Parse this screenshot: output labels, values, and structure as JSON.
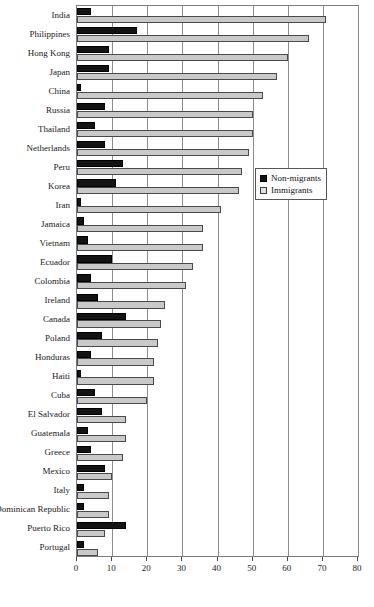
{
  "chart_data": {
    "type": "bar",
    "orientation": "horizontal",
    "title": "Table 4. Percentage of ...",
    "xlabel": "",
    "ylabel": "",
    "xlim": [
      0,
      80
    ],
    "xticks": [
      0,
      10,
      20,
      30,
      40,
      50,
      60,
      70,
      80
    ],
    "grid": true,
    "legend_position": "right-middle",
    "categories": [
      "India",
      "Philippines",
      "Hong Kong",
      "Japan",
      "China",
      "Russia",
      "Thailand",
      "Netherlands",
      "Peru",
      "Korea",
      "Iran",
      "Jamaica",
      "Vietnam",
      "Ecuador",
      "Colombia",
      "Ireland",
      "Canada",
      "Poland",
      "Honduras",
      "Haiti",
      "Cuba",
      "El Salvador",
      "Guatemala",
      "Greece",
      "Mexico",
      "Italy",
      "Dominican Republic",
      "Puerto Rico",
      "Portugal"
    ],
    "series": [
      {
        "name": "Non-migrants",
        "color": "#131313",
        "values": [
          4,
          17,
          9,
          9,
          1,
          8,
          5,
          8,
          13,
          11,
          1,
          2,
          3,
          10,
          4,
          6,
          14,
          7,
          4,
          1,
          5,
          7,
          3,
          4,
          8,
          2,
          2,
          14,
          2
        ]
      },
      {
        "name": "Immigrants",
        "color": "#c9c9c9",
        "values": [
          71,
          66,
          60,
          57,
          53,
          50,
          50,
          49,
          47,
          46,
          41,
          36,
          36,
          33,
          31,
          25,
          24,
          23,
          22,
          22,
          20,
          14,
          14,
          13,
          10,
          9,
          9,
          8,
          6
        ]
      }
    ]
  },
  "legend": {
    "entries": [
      {
        "label": "Non-migrants"
      },
      {
        "label": "Immigrants"
      }
    ]
  }
}
